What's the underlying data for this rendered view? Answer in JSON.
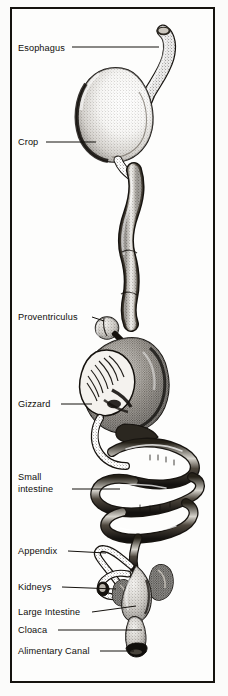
{
  "figure": {
    "title": "Alimentary Canal",
    "style": "black-and-white stippled ink illustration",
    "frame_color": "#15130f",
    "paper_color": "#fdfdfc",
    "ink_color": "#100e0b"
  },
  "labels": [
    {
      "id": "esophagus",
      "text": "Esophagus",
      "leader_from_x": 72,
      "leader_to_x": 148,
      "leader_y": 47
    },
    {
      "id": "crop",
      "text": "Crop",
      "leader_from_x": 46,
      "leader_to_x": 96,
      "leader_y": 142
    },
    {
      "id": "proventriculus",
      "text": "Proventriculus",
      "leader_from_x": 92,
      "leader_to_x": 110,
      "leader_y": 317
    },
    {
      "id": "gizzard",
      "text": "Gizzard",
      "leader_from_x": 61,
      "leader_to_x": 100,
      "leader_y": 404
    },
    {
      "id": "small_intestine_line1",
      "text": "Small",
      "leader_from_x": null,
      "leader_to_x": null,
      "leader_y": null
    },
    {
      "id": "small_intestine_line2",
      "text": "intestine",
      "leader_from_x": 72,
      "leader_to_x": 122,
      "leader_y": 489
    },
    {
      "id": "appendix",
      "text": "Appendix",
      "leader_from_x": 68,
      "leader_to_x": 110,
      "leader_y": 551
    },
    {
      "id": "kidneys",
      "text": "Kidneys",
      "leader_from_x": 62,
      "leader_to_x": 126,
      "leader_y": 587
    },
    {
      "id": "large_intestine",
      "text": "Large Intestine",
      "leader_from_x": 92,
      "leader_to_x": 146,
      "leader_y": 612
    },
    {
      "id": "cloaca",
      "text": "Cloaca",
      "leader_from_x": 58,
      "leader_to_x": 150,
      "leader_y": 630
    },
    {
      "id": "alimentary",
      "text": "Alimentary Canal",
      "leader_from_x": 100,
      "leader_to_x": 148,
      "leader_y": 651
    }
  ],
  "organs": [
    {
      "id": "esophagus",
      "name": "Esophagus"
    },
    {
      "id": "crop",
      "name": "Crop"
    },
    {
      "id": "proventriculus",
      "name": "Proventriculus"
    },
    {
      "id": "gizzard",
      "name": "Gizzard"
    },
    {
      "id": "small_intestine",
      "name": "Small intestine"
    },
    {
      "id": "appendix",
      "name": "Appendix"
    },
    {
      "id": "kidneys",
      "name": "Kidneys"
    },
    {
      "id": "large_intestine",
      "name": "Large Intestine"
    },
    {
      "id": "cloaca",
      "name": "Cloaca"
    }
  ]
}
